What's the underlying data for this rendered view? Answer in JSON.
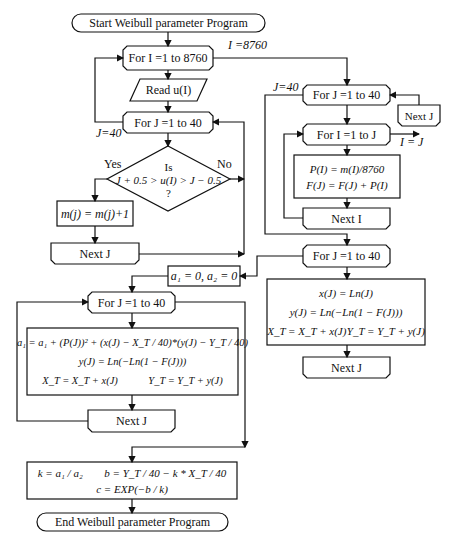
{
  "nodes": {
    "start": "Start Weibull parameter Program",
    "for_i_8760": "For I =1 to 8760",
    "read_u": "Read u(I)",
    "for_j_left": "For J =1 to 40",
    "decision": {
      "line1": "Is",
      "line2": "J + 0.5 > u(I) > J − 0.5",
      "line3": "?"
    },
    "increment_m": "m(j) = m(j)+1",
    "next_j_left": "Next J",
    "init_a": "a₁ = 0, a₂ = 0",
    "for_j_bottom": "For J =1 to 40",
    "regression_box": {
      "line1": "a₁ = a₁ + (P(J))² + (x(J) − X_T / 40)*(y(J) − Y_T / 40)",
      "line2": "y(J) = Ln(−Ln(1 − F(J)))",
      "line3a": "X_T = X_T + x(J)",
      "line3b": "Y_T = Y_T + y(J)"
    },
    "next_j_bottom": "Next J",
    "result_box": {
      "k": "k = a₁ / a₂",
      "b": "b = Y_T / 40 − k * X_T / 40",
      "c": "c = EXP(−b / k)"
    },
    "end": "End Weibull parameter Program",
    "for_j_right": "For J =1 to 40",
    "next_j_right_small": "Next J",
    "for_i_to_j": "For I =1 to J",
    "prob_box": {
      "line1": "P(I) = m(I)/8760",
      "line2": "F(J) = F(J) + P(I)"
    },
    "next_i": "Next I",
    "for_j_right_lower": "For J =1 to 40",
    "xy_box": {
      "line1": "x(J) = Ln(J)",
      "line2": "y(J) = Ln(−Ln(1 − F(J)))",
      "line3a": "X_T = X_T + x(J)",
      "line3b": "Y_T = Y_T + y(J)"
    },
    "next_j_right_lower": "Next J"
  },
  "labels": {
    "i_8760": "I =8760",
    "j_40_left": "J=40",
    "j_40_right": "J=40",
    "yes": "Yes",
    "no": "No",
    "i_eq_j": "I = J"
  }
}
